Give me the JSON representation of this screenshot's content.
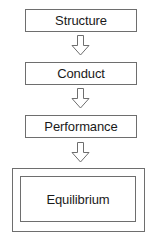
{
  "diagram": {
    "background_color": "#ffffff",
    "border_color": "#6e6e6e",
    "text_color": "#1a1a1a",
    "nodes": [
      {
        "id": "structure",
        "label": "Structure",
        "shape": "rectangle"
      },
      {
        "id": "conduct",
        "label": "Conduct",
        "shape": "rectangle"
      },
      {
        "id": "performance",
        "label": "Performance",
        "shape": "rectangle"
      },
      {
        "id": "equilibrium",
        "label": "Equilibrium",
        "shape": "double-rectangle"
      }
    ],
    "connectors": [
      {
        "id": "structure-to-conduct",
        "icon": "block-arrow-down-icon",
        "from": "structure",
        "to": "conduct"
      },
      {
        "id": "conduct-to-performance",
        "icon": "block-arrow-down-icon",
        "from": "conduct",
        "to": "performance"
      },
      {
        "id": "performance-to-equilibrium",
        "icon": "block-arrow-down-icon",
        "from": "performance",
        "to": "equilibrium"
      }
    ]
  }
}
